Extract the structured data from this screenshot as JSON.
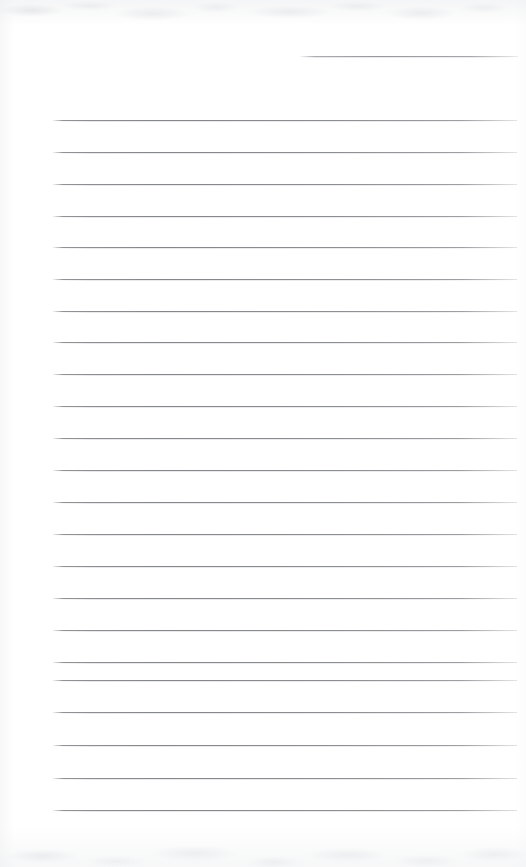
{
  "document": {
    "kind": "scanned-ruled-notepad-page",
    "title": "Blank lined notepad page",
    "description": "Scanned blank sheet of ruled notepaper with no handwriting or printed text",
    "page_width": 526,
    "page_height": 867,
    "background_color": "#ffffff",
    "rule_color": "#8e8f93",
    "content_text": "",
    "visible_text": []
  },
  "ruling": {
    "style": "horizontal-rules",
    "rule_thickness": 1,
    "line_spacing": 32,
    "left_margin_x": 53,
    "right_margin_x": 517,
    "full_rule_count": 23,
    "header_rule": {
      "name": "top-right-short-rule",
      "x": 300,
      "y": 56,
      "width": 218
    },
    "rules": [
      {
        "y": 120,
        "x": 53,
        "width": 464
      },
      {
        "y": 152,
        "x": 53,
        "width": 464
      },
      {
        "y": 184,
        "x": 53,
        "width": 464
      },
      {
        "y": 216,
        "x": 53,
        "width": 464
      },
      {
        "y": 247,
        "x": 53,
        "width": 464
      },
      {
        "y": 279,
        "x": 53,
        "width": 464
      },
      {
        "y": 311,
        "x": 53,
        "width": 464
      },
      {
        "y": 342,
        "x": 53,
        "width": 464
      },
      {
        "y": 374,
        "x": 53,
        "width": 464
      },
      {
        "y": 406,
        "x": 53,
        "width": 464
      },
      {
        "y": 438,
        "x": 53,
        "width": 464
      },
      {
        "y": 470,
        "x": 53,
        "width": 464
      },
      {
        "y": 502,
        "x": 53,
        "width": 464
      },
      {
        "y": 534,
        "x": 53,
        "width": 464
      },
      {
        "y": 566,
        "x": 53,
        "width": 464
      },
      {
        "y": 598,
        "x": 53,
        "width": 464
      },
      {
        "y": 630,
        "x": 53,
        "width": 464
      },
      {
        "y": 662,
        "x": 53,
        "width": 464
      },
      {
        "y": 680,
        "x": 53,
        "width": 464
      },
      {
        "y": 712,
        "x": 53,
        "width": 464
      },
      {
        "y": 745,
        "x": 53,
        "width": 464
      },
      {
        "y": 778,
        "x": 53,
        "width": 464
      },
      {
        "y": 810,
        "x": 53,
        "width": 464
      }
    ]
  },
  "scan_artifacts": {
    "top_noise_band": {
      "y": 0,
      "height": 26,
      "color": "#eceded"
    },
    "bottom_noise_band": {
      "y": 827,
      "height": 40,
      "color": "#eeeff1"
    },
    "left_edge_tint": {
      "x": 0,
      "width": 14,
      "color": "#f6f6f7"
    },
    "right_edge_tint": {
      "x": 516,
      "width": 10,
      "color": "#fafafb"
    }
  }
}
